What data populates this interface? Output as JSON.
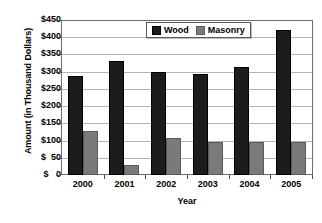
{
  "chart_data": {
    "type": "bar",
    "title": "",
    "xlabel": "Year",
    "ylabel": "Amount (in Thousand Dollars)",
    "categories": [
      "2000",
      "2001",
      "2002",
      "2003",
      "2004",
      "2005"
    ],
    "series": [
      {
        "name": "Wood",
        "color": "#1c1c1c",
        "values": [
          288,
          330,
          300,
          292,
          315,
          420
        ]
      },
      {
        "name": "Masonry",
        "color": "#7a7a7a",
        "values": [
          127,
          30,
          108,
          97,
          97,
          95
        ]
      }
    ],
    "ylim": [
      0,
      450
    ],
    "ytick_step": 50,
    "ytick_labels": [
      "$450",
      "$400",
      "$350",
      "$300",
      "$250",
      "$200",
      "$150",
      "$100",
      "$  50",
      "$   0"
    ],
    "ytick_values": [
      450,
      400,
      350,
      300,
      250,
      200,
      150,
      100,
      50,
      0
    ],
    "grid": true,
    "legend_position": "top-center"
  },
  "legend": {
    "entries": [
      {
        "label": "Wood"
      },
      {
        "label": "Masonry"
      }
    ]
  }
}
